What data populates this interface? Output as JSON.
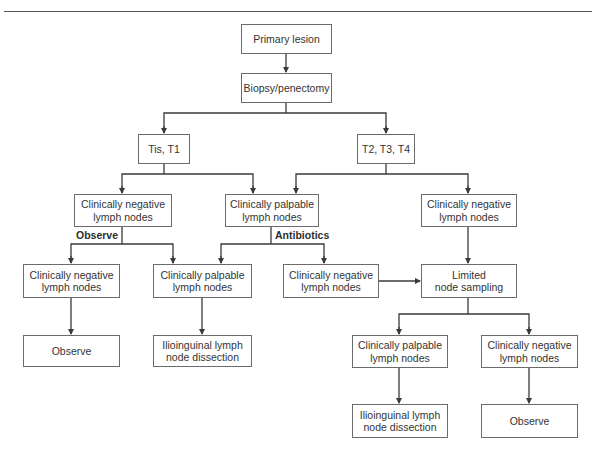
{
  "diagram": {
    "type": "flowchart",
    "nodes": [
      {
        "id": "primary",
        "lines": [
          "Primary lesion"
        ],
        "x": 241,
        "y": 24,
        "w": 91,
        "h": 30
      },
      {
        "id": "biopsy",
        "lines": [
          "Biopsy/penectomy"
        ],
        "x": 241,
        "y": 73,
        "w": 91,
        "h": 30
      },
      {
        "id": "tis_t1",
        "lines": [
          "Tis, T1"
        ],
        "x": 138,
        "y": 134,
        "w": 52,
        "h": 30
      },
      {
        "id": "t2_t4",
        "lines": [
          "T2, T3, T4"
        ],
        "x": 357,
        "y": 134,
        "w": 58,
        "h": 30
      },
      {
        "id": "l3_neg_left",
        "lines": [
          "Clinically negative",
          "lymph nodes"
        ],
        "x": 74,
        "y": 194,
        "w": 98,
        "h": 33
      },
      {
        "id": "l3_palp_mid",
        "lines": [
          "Clinically palpable",
          "lymph nodes"
        ],
        "x": 225,
        "y": 194,
        "w": 94,
        "h": 33
      },
      {
        "id": "l3_neg_right",
        "lines": [
          "Clinically negative",
          "lymph nodes"
        ],
        "x": 421,
        "y": 194,
        "w": 96,
        "h": 33
      },
      {
        "id": "l4_neg_far_left",
        "lines": [
          "Clinically negative",
          "lymph nodes"
        ],
        "x": 23,
        "y": 264,
        "w": 97,
        "h": 34
      },
      {
        "id": "l4_palp_left",
        "lines": [
          "Clinically palpable",
          "lymph nodes"
        ],
        "x": 153,
        "y": 264,
        "w": 99,
        "h": 34
      },
      {
        "id": "l4_neg_mid",
        "lines": [
          "Clinically negative",
          "lymph nodes"
        ],
        "x": 283,
        "y": 264,
        "w": 96,
        "h": 34
      },
      {
        "id": "limited_sampling",
        "lines": [
          "Limited",
          "node sampling"
        ],
        "x": 421,
        "y": 264,
        "w": 96,
        "h": 34
      },
      {
        "id": "l5_observe_left",
        "lines": [
          "Observe"
        ],
        "x": 23,
        "y": 335,
        "w": 97,
        "h": 32
      },
      {
        "id": "l5_dissection_left",
        "lines": [
          "Ilioinguinal lymph",
          "node dissection"
        ],
        "x": 153,
        "y": 335,
        "w": 99,
        "h": 32
      },
      {
        "id": "l5_palp_right",
        "lines": [
          "Clinically palpable",
          "lymph nodes"
        ],
        "x": 352,
        "y": 335,
        "w": 96,
        "h": 33
      },
      {
        "id": "l5_neg_right",
        "lines": [
          "Clinically negative",
          "lymph nodes"
        ],
        "x": 481,
        "y": 335,
        "w": 97,
        "h": 33
      },
      {
        "id": "l6_dissection_right",
        "lines": [
          "Ilioinguinal lymph",
          "node dissection"
        ],
        "x": 352,
        "y": 404,
        "w": 96,
        "h": 34
      },
      {
        "id": "l6_observe_right",
        "lines": [
          "Observe"
        ],
        "x": 481,
        "y": 404,
        "w": 97,
        "h": 34
      }
    ],
    "edge_labels": [
      {
        "id": "observe_label",
        "text": "Observe",
        "x": 76,
        "y": 229
      },
      {
        "id": "antibiotics_label",
        "text": "Antibiotics",
        "x": 275,
        "y": 229
      }
    ],
    "edges": [
      {
        "from": "primary",
        "to": "biopsy"
      },
      {
        "from": "biopsy",
        "to": "tis_t1"
      },
      {
        "from": "biopsy",
        "to": "t2_t4"
      },
      {
        "from": "tis_t1",
        "to": "l3_neg_left"
      },
      {
        "from": "tis_t1",
        "to": "l3_palp_mid"
      },
      {
        "from": "t2_t4",
        "to": "l3_palp_mid"
      },
      {
        "from": "t2_t4",
        "to": "l3_neg_right"
      },
      {
        "from": "l3_neg_left",
        "to": "l4_neg_far_left",
        "label": "Observe"
      },
      {
        "from": "l3_neg_left",
        "to": "l4_palp_left",
        "label": "Observe"
      },
      {
        "from": "l3_palp_mid",
        "to": "l4_palp_left",
        "label": "Antibiotics"
      },
      {
        "from": "l3_palp_mid",
        "to": "l4_neg_mid",
        "label": "Antibiotics"
      },
      {
        "from": "l3_neg_right",
        "to": "limited_sampling"
      },
      {
        "from": "l4_neg_mid",
        "to": "limited_sampling"
      },
      {
        "from": "l4_neg_far_left",
        "to": "l5_observe_left"
      },
      {
        "from": "l4_palp_left",
        "to": "l5_dissection_left"
      },
      {
        "from": "limited_sampling",
        "to": "l5_palp_right"
      },
      {
        "from": "limited_sampling",
        "to": "l5_neg_right"
      },
      {
        "from": "l5_palp_right",
        "to": "l6_dissection_right"
      },
      {
        "from": "l5_neg_right",
        "to": "l6_observe_right"
      }
    ],
    "colors": {
      "line": "#3a3a3a",
      "box_border": "#6b6b6b",
      "text": "#333333"
    }
  }
}
